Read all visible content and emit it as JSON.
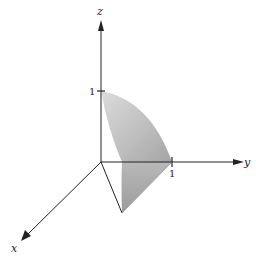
{
  "axes": {
    "x_label": "x",
    "y_label": "y",
    "z_label": "z",
    "z_tick": "1",
    "y_tick": "1"
  },
  "colors": {
    "axis": "#222222",
    "surface_light": "#d4d4d4",
    "surface_dark": "#a8a8a8"
  }
}
